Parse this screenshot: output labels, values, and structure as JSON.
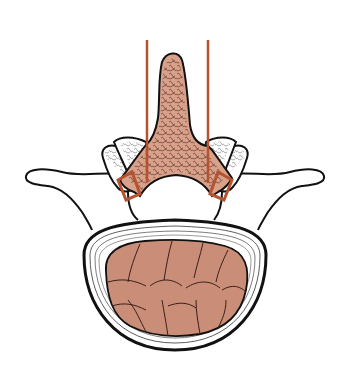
{
  "diagram": {
    "parts": [
      "spinous process",
      "laminae",
      "transverse processes",
      "facet joints",
      "vertebral body",
      "annulus fibrosus",
      "nucleus pulposus"
    ],
    "markers": {
      "left_line_x": 147,
      "right_line_x": 208,
      "line_top_y": 40
    }
  },
  "colors": {
    "bone_fill": "#d9a08a",
    "tissue_fill": "#c98d78",
    "marker": "#b5532f",
    "outline": "#111111",
    "background": "#ffffff"
  }
}
